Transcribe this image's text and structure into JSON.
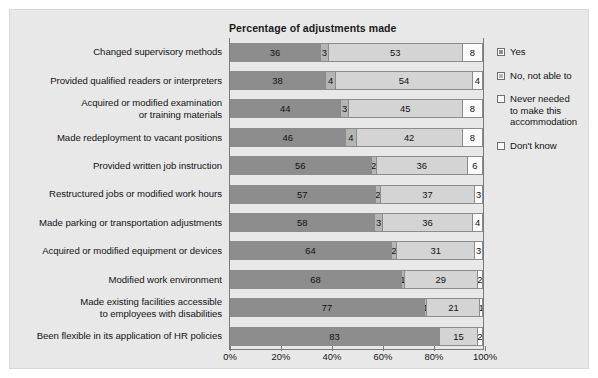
{
  "chart_data": {
    "type": "bar",
    "orientation": "horizontal",
    "stacked": true,
    "normalized": true,
    "title": "Percentage of adjustments made",
    "xlabel": "",
    "ylabel": "",
    "xlim": [
      0,
      100
    ],
    "grid": false,
    "legend_position": "right",
    "xticks": [
      "0%",
      "20%",
      "40%",
      "60%",
      "80%",
      "100%"
    ],
    "xtick_values": [
      0,
      20,
      40,
      60,
      80,
      100
    ],
    "categories": [
      "Changed supervisory methods",
      "Provided qualified readers or interpreters",
      "Acquired or modified examination\nor training materials",
      "Made redeployment to vacant positions",
      "Provided written job instruction",
      "Restructured jobs or modified work hours",
      "Made parking or transportation adjustments",
      "Acquired or modified equipment or devices",
      "Modified work environment",
      "Made existing facilities accessible\nto employees with disabilities",
      "Been flexible in its application of HR policies"
    ],
    "series": [
      {
        "name": "Yes",
        "color": "#8d8d8d",
        "values": [
          36,
          38,
          44,
          46,
          56,
          57,
          58,
          64,
          68,
          77,
          83
        ]
      },
      {
        "name": "No, not able to",
        "color": "#b5b5b5",
        "values": [
          3,
          4,
          3,
          4,
          2,
          2,
          3,
          2,
          1,
          1,
          0
        ]
      },
      {
        "name": "Never needed to make this accommodation",
        "color": "#d4d4d4",
        "values": [
          53,
          54,
          45,
          42,
          36,
          37,
          36,
          31,
          29,
          21,
          15
        ]
      },
      {
        "name": "Don't know",
        "color": "#fbfbfb",
        "values": [
          8,
          4,
          8,
          8,
          6,
          3,
          4,
          3,
          2,
          1,
          2
        ]
      }
    ],
    "legend_entries": [
      "Yes",
      "No, not able to",
      "Never needed\nto make this\naccommodation",
      "Don't know"
    ]
  }
}
